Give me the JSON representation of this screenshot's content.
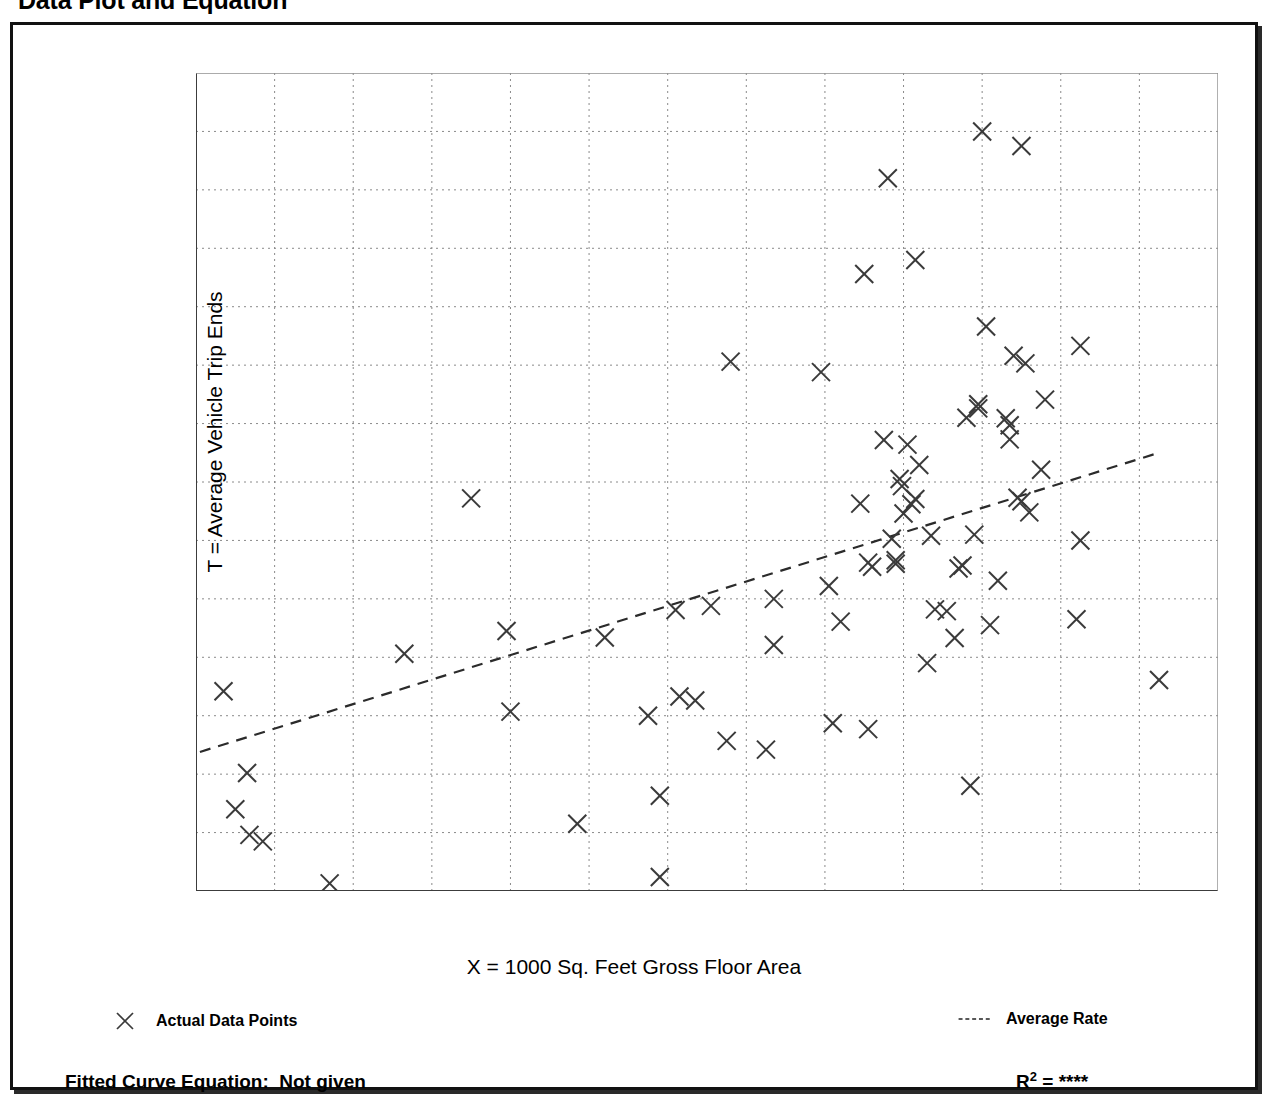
{
  "page": {
    "title": "Data Plot and Equation"
  },
  "legend": {
    "points": {
      "marker": "x-marker-icon",
      "label": "Actual Data Points"
    },
    "rate": {
      "marker": "dashed-line-icon",
      "label": "Average Rate"
    }
  },
  "footer": {
    "equation_label": "Fitted Curve Equation:",
    "equation_value": "Not given",
    "r2_label": "R",
    "r2_exponent": "2",
    "r2_equals": "=",
    "r2_value": "****"
  },
  "chart_data": {
    "type": "scatter",
    "title": "Data Plot and Equation",
    "xlabel": "X = 1000 Sq. Feet Gross Floor Area",
    "ylabel": "T = Average Vehicle Trip Ends",
    "xlim": [
      120,
      250
    ],
    "ylim": [
      300,
      1700
    ],
    "xticks": [
      120,
      130,
      140,
      150,
      160,
      170,
      180,
      190,
      200,
      210,
      220,
      230,
      240,
      250
    ],
    "yticks": [
      300,
      400,
      500,
      600,
      700,
      800,
      900,
      1000,
      1100,
      1200,
      1300,
      1400,
      1500,
      1600,
      1700
    ],
    "xtick_labels": [
      "120",
      "130",
      "140",
      "150",
      "160",
      "170",
      "180",
      "190",
      "200",
      "210",
      "220",
      "230",
      "240",
      "250"
    ],
    "ytick_labels": [
      "300",
      "400",
      "500",
      "600",
      "700",
      "800",
      "900",
      "1,000",
      "1,100",
      "1,200",
      "1,300",
      "1,400",
      "1,500",
      "1,600",
      "1,700"
    ],
    "x_minor_tick_step": 5,
    "y_minor_tick_step": 50,
    "grid": true,
    "grid_style": "dotted",
    "legend_position": "below-axes",
    "series": [
      {
        "name": "Actual Data Points",
        "marker": "x",
        "points": [
          [
            123.5,
            642
          ],
          [
            125.0,
            440
          ],
          [
            126.5,
            502
          ],
          [
            126.8,
            396
          ],
          [
            128.5,
            385
          ],
          [
            137.0,
            313
          ],
          [
            146.5,
            706
          ],
          [
            155.0,
            972
          ],
          [
            159.5,
            745
          ],
          [
            160.0,
            607
          ],
          [
            168.5,
            415
          ],
          [
            172.0,
            734
          ],
          [
            177.5,
            600
          ],
          [
            179.0,
            324
          ],
          [
            179.0,
            463
          ],
          [
            181.0,
            781
          ],
          [
            181.5,
            633
          ],
          [
            183.5,
            626
          ],
          [
            185.5,
            788
          ],
          [
            187.5,
            557
          ],
          [
            188.0,
            1206
          ],
          [
            192.5,
            542
          ],
          [
            193.5,
            721
          ],
          [
            193.5,
            800
          ],
          [
            199.5,
            1188
          ],
          [
            200.5,
            822
          ],
          [
            201.0,
            587
          ],
          [
            202.0,
            761
          ],
          [
            204.5,
            963
          ],
          [
            205.0,
            1356
          ],
          [
            205.5,
            577
          ],
          [
            205.5,
            862
          ],
          [
            206.0,
            855
          ],
          [
            207.5,
            1072
          ],
          [
            208.0,
            1520
          ],
          [
            208.5,
            903
          ],
          [
            209.0,
            866
          ],
          [
            209.0,
            860
          ],
          [
            209.5,
            1005
          ],
          [
            209.8,
            993
          ],
          [
            210.0,
            946
          ],
          [
            210.5,
            1064
          ],
          [
            211.0,
            962
          ],
          [
            211.5,
            971
          ],
          [
            211.5,
            1380
          ],
          [
            212.0,
            1029
          ],
          [
            213.0,
            690
          ],
          [
            213.5,
            908
          ],
          [
            214.0,
            782
          ],
          [
            215.5,
            779
          ],
          [
            216.5,
            733
          ],
          [
            217.0,
            852
          ],
          [
            217.5,
            857
          ],
          [
            218.0,
            1110
          ],
          [
            218.5,
            480
          ],
          [
            219.0,
            910
          ],
          [
            219.5,
            1133
          ],
          [
            219.5,
            1126
          ],
          [
            220.0,
            1600
          ],
          [
            220.5,
            1266
          ],
          [
            221.0,
            755
          ],
          [
            222.0,
            831
          ],
          [
            223.0,
            1109
          ],
          [
            223.5,
            1097
          ],
          [
            223.5,
            1073
          ],
          [
            224.0,
            1216
          ],
          [
            224.5,
            973
          ],
          [
            225.0,
            967
          ],
          [
            225.0,
            1575
          ],
          [
            225.5,
            1203
          ],
          [
            226.0,
            948
          ],
          [
            227.5,
            1021
          ],
          [
            228.0,
            1141
          ],
          [
            232.0,
            765
          ],
          [
            232.5,
            900
          ],
          [
            232.5,
            1233
          ],
          [
            242.5,
            661
          ]
        ]
      }
    ],
    "trendline": {
      "name": "Average Rate",
      "style": "dashed",
      "x_start": 120.5,
      "y_start": 538,
      "x_end": 242.0,
      "y_end": 1048
    }
  }
}
